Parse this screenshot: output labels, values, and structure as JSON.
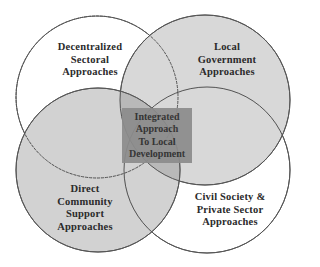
{
  "diagram": {
    "type": "venn",
    "center": {
      "label": "Integrated Approach To Local Development",
      "lines": [
        "Integrated",
        "Approach",
        "To Local",
        "Development"
      ]
    },
    "circles": [
      {
        "id": "top-left",
        "label": "Decentralized Sectoral Approaches",
        "lines": [
          "Decentralized",
          "Sectoral",
          "Approaches"
        ],
        "fill": "#ffffff"
      },
      {
        "id": "top-right",
        "label": "Local Government Approaches",
        "lines": [
          "Local",
          "Government",
          "Approaches"
        ],
        "fill": "#d8d8d8"
      },
      {
        "id": "bottom-left",
        "label": "Direct Community Support Approaches",
        "lines": [
          "Direct",
          "Community",
          "Support",
          "Approaches"
        ],
        "fill": "#cfcfcf"
      },
      {
        "id": "bottom-right",
        "label": "Civil Society & Private Sector Approaches",
        "lines": [
          "Civil Society &",
          "Private Sector",
          "Approaches"
        ],
        "fill": "#ffffff"
      }
    ],
    "colors": {
      "stroke": "#555555",
      "overlap": "#bdbdbd",
      "center_box": "#8c8c8c"
    }
  }
}
